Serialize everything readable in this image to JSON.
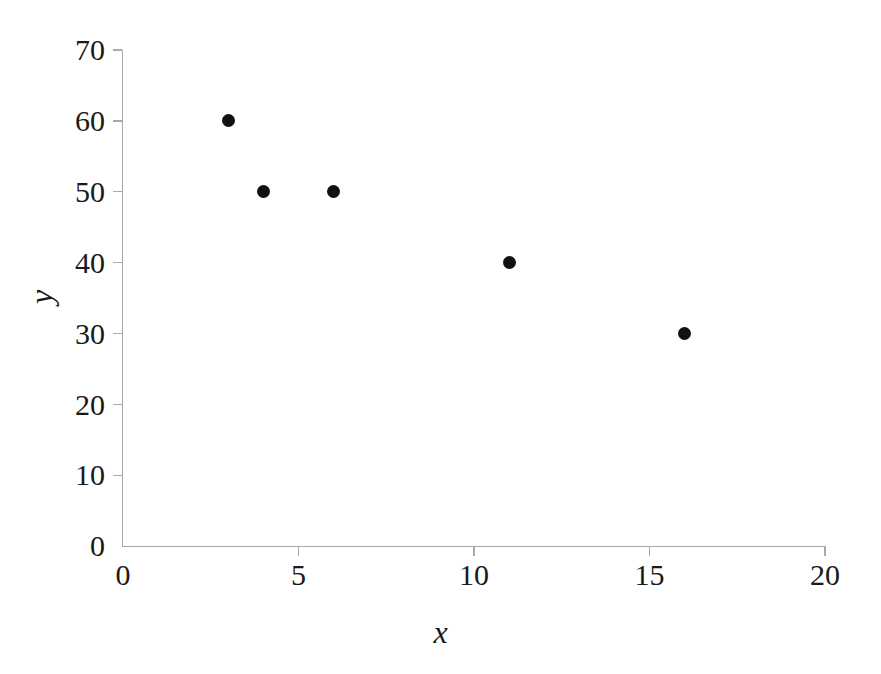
{
  "chart_data": {
    "type": "scatter",
    "title": "",
    "xlabel": "x",
    "ylabel": "y",
    "xlim": [
      0,
      20
    ],
    "ylim": [
      0,
      70
    ],
    "xticks": [
      0,
      5,
      10,
      15,
      20
    ],
    "yticks": [
      0,
      10,
      20,
      30,
      40,
      50,
      60,
      70
    ],
    "xtick_labels": [
      "0",
      "5",
      "10",
      "15",
      "20"
    ],
    "ytick_labels": [
      "0",
      "10",
      "20",
      "30",
      "40",
      "50",
      "60",
      "70"
    ],
    "grid": false,
    "legend": null,
    "legend_position": "none",
    "marker": "filled-circle",
    "marker_color": "#111111",
    "axis_color": "#a9a9a9",
    "background_color": "#ffffff",
    "points": [
      {
        "x": 3,
        "y": 60
      },
      {
        "x": 4,
        "y": 50
      },
      {
        "x": 6,
        "y": 50
      },
      {
        "x": 11,
        "y": 40
      },
      {
        "x": 16,
        "y": 30
      }
    ],
    "x": [
      3,
      4,
      6,
      11,
      16
    ],
    "values": [
      60,
      50,
      50,
      40,
      30
    ]
  }
}
